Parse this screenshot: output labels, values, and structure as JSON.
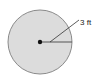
{
  "diagram": {
    "shape": "circle",
    "radius_label": "3 ft",
    "colors": {
      "fill": "#dcdcdc",
      "stroke": "#8a8a8a",
      "line": "#555555",
      "center": "#111111"
    }
  }
}
